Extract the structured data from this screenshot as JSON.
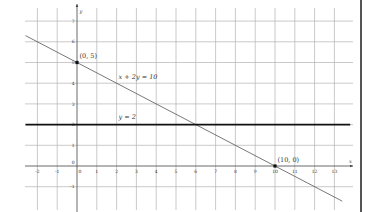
{
  "chart_data": {
    "type": "line",
    "title": "",
    "xlabel": "x",
    "ylabel": "y",
    "xlim": [
      -2.6,
      13.8
    ],
    "ylim": [
      -2.1,
      7.8
    ],
    "grid": true,
    "x_ticks": [
      -2,
      -1,
      0,
      1,
      2,
      3,
      4,
      5,
      6,
      7,
      8,
      9,
      10,
      11,
      12,
      13
    ],
    "y_ticks": [
      -1,
      0,
      1,
      2,
      3,
      4,
      5,
      6,
      7
    ],
    "series": [
      {
        "name": "x + 2y = 10",
        "label": "x + 2y = 10",
        "equation": "x + 2y = 10",
        "x": [
          -2.6,
          13.4
        ],
        "values": [
          6.3,
          -1.7
        ],
        "color": "#555555",
        "width": 0.8
      },
      {
        "name": "y = 2",
        "label": "y = 2",
        "equation": "y = 2",
        "x": [
          -2.6,
          13.8
        ],
        "values": [
          2,
          2
        ],
        "color": "#111111",
        "width": 1.8
      }
    ],
    "points": [
      {
        "x": 0,
        "y": 5,
        "label": "(0, 5)"
      },
      {
        "x": 10,
        "y": 0,
        "label": "(10, 0)"
      }
    ],
    "annotations": [
      {
        "text": "x + 2y = 10",
        "x": 2.1,
        "y": 4.2
      },
      {
        "text": "y = 2",
        "x": 2.1,
        "y": 2.25
      }
    ]
  },
  "colors": {
    "grid": "#b3b3b3",
    "axis": "#444444",
    "background": "#ffffff"
  }
}
